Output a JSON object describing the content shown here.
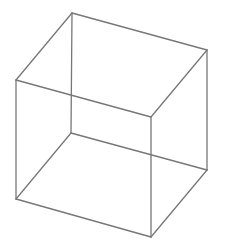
{
  "diagram": {
    "type": "wireframe-cube",
    "background": "#ffffff",
    "stroke_color": "#777777",
    "stroke_width": 1.3,
    "vertices": {
      "back_top_left": [
        72,
        13
      ],
      "back_top_right": [
        207,
        50
      ],
      "back_bottom_left": [
        71,
        133
      ],
      "back_bottom_right": [
        207,
        170
      ],
      "front_top_left": [
        16,
        80
      ],
      "front_top_right": [
        151,
        117
      ],
      "front_bottom_left": [
        16,
        199
      ],
      "front_bottom_right": [
        151,
        237
      ]
    },
    "edges": [
      [
        "back_top_left",
        "back_top_right"
      ],
      [
        "back_top_left",
        "front_top_left"
      ],
      [
        "back_top_right",
        "front_top_right"
      ],
      [
        "front_top_left",
        "front_top_right"
      ],
      [
        "back_bottom_left",
        "back_bottom_right"
      ],
      [
        "back_bottom_left",
        "front_bottom_left"
      ],
      [
        "back_bottom_right",
        "front_bottom_right"
      ],
      [
        "front_bottom_left",
        "front_bottom_right"
      ],
      [
        "back_top_left",
        "back_bottom_left"
      ],
      [
        "back_top_right",
        "back_bottom_right"
      ],
      [
        "front_top_left",
        "front_bottom_left"
      ],
      [
        "front_top_right",
        "front_bottom_right"
      ]
    ]
  }
}
